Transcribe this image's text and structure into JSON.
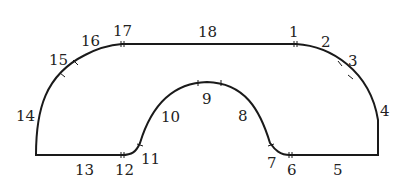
{
  "diagram": {
    "type": "closed track outline with numbered segments",
    "segments": [
      {
        "id": 1,
        "label": "1",
        "x": 295,
        "y": 37
      },
      {
        "id": 2,
        "label": "2",
        "x": 327,
        "y": 47
      },
      {
        "id": 3,
        "label": "3",
        "x": 354,
        "y": 66
      },
      {
        "id": 4,
        "label": "4",
        "x": 385,
        "y": 116
      },
      {
        "id": 5,
        "label": "5",
        "x": 338,
        "y": 175
      },
      {
        "id": 6,
        "label": "6",
        "x": 292,
        "y": 174
      },
      {
        "id": 7,
        "label": "7",
        "x": 272,
        "y": 167
      },
      {
        "id": 8,
        "label": "8",
        "x": 243,
        "y": 120
      },
      {
        "id": 9,
        "label": "9",
        "x": 207,
        "y": 103
      },
      {
        "id": 10,
        "label": "10",
        "x": 170,
        "y": 121
      },
      {
        "id": 11,
        "label": "11",
        "x": 150,
        "y": 164
      },
      {
        "id": 12,
        "label": "12",
        "x": 124,
        "y": 174
      },
      {
        "id": 13,
        "label": "13",
        "x": 84,
        "y": 174
      },
      {
        "id": 14,
        "label": "14",
        "x": 24,
        "y": 120
      },
      {
        "id": 15,
        "label": "15",
        "x": 57,
        "y": 65
      },
      {
        "id": 16,
        "label": "16",
        "x": 90,
        "y": 46
      },
      {
        "id": 17,
        "label": "17",
        "x": 123,
        "y": 37
      },
      {
        "id": 18,
        "label": "18",
        "x": 207,
        "y": 37
      }
    ]
  }
}
